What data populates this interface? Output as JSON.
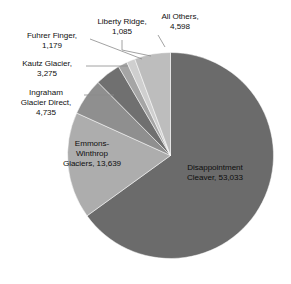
{
  "chart_data": {
    "type": "pie",
    "title": "",
    "subtitle": "",
    "xlabel": "",
    "ylabel": "",
    "legend_position": "none",
    "grid": false,
    "total": 81544,
    "start_angle_deg": 0,
    "direction": "clockwise",
    "categories": [
      "Disappointment Cleaver",
      "Emmons-Winthrop Glaciers",
      "Ingraham Glacier Direct",
      "Kautz Glacier",
      "Fuhrer Finger",
      "Liberty Ridge",
      "All Others"
    ],
    "values": [
      53033,
      13639,
      4735,
      3275,
      1179,
      1085,
      4598
    ],
    "colors": [
      "#6b6b6b",
      "#adadad",
      "#8f8f8f",
      "#707070",
      "#a5a5a5",
      "#cfcfcf",
      "#bdbdbd"
    ],
    "slices": [
      {
        "name": "Disappointment Cleaver",
        "value": 53033,
        "value_text": "53,033",
        "label": "Disappointment\nCleaver, 53,033",
        "color": "#6b6b6b",
        "label_placement": "inside"
      },
      {
        "name": "Emmons-Winthrop Glaciers",
        "value": 13639,
        "value_text": "13,639",
        "label": "Emmons-\nWinthrop\nGlaciers, 13,639",
        "color": "#adadad",
        "label_placement": "inside"
      },
      {
        "name": "Ingraham Glacier Direct",
        "value": 4735,
        "value_text": "4,735",
        "label": "Ingraham\nGlacier Direct,\n4,735",
        "color": "#8f8f8f",
        "label_placement": "outside-leader"
      },
      {
        "name": "Kautz Glacier",
        "value": 3275,
        "value_text": "3,275",
        "label": "Kautz Glacier,\n3,275",
        "color": "#707070",
        "label_placement": "outside-leader"
      },
      {
        "name": "Fuhrer Finger",
        "value": 1179,
        "value_text": "1,179",
        "label": "Fuhrer Finger,\n1,179",
        "color": "#a5a5a5",
        "label_placement": "outside-leader"
      },
      {
        "name": "Liberty Ridge",
        "value": 1085,
        "value_text": "1,085",
        "label": "Liberty Ridge,\n1,085",
        "color": "#cfcfcf",
        "label_placement": "outside-leader"
      },
      {
        "name": "All Others",
        "value": 4598,
        "value_text": "4,598",
        "label": "All Others,\n4,598",
        "color": "#bdbdbd",
        "label_placement": "outside-leader"
      }
    ]
  },
  "style": {
    "background": "#ffffff",
    "leader_line_color": "#8a8a8a",
    "label_text_color": "#111111"
  }
}
